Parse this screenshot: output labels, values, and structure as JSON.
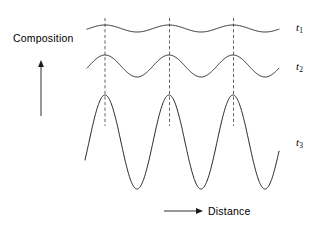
{
  "figure": {
    "background_color": "#ffffff",
    "curve_color": "#1a1a1a",
    "guide_color": "#3a3a3a",
    "width": 319,
    "height": 233
  },
  "axes": {
    "y_axis_label": "Composition",
    "x_axis_label": "Distance",
    "y_arrow": {
      "x": 41,
      "y_from": 116,
      "y_to": 60
    },
    "x_arrow": {
      "y": 211,
      "x_from": 164,
      "x_to": 203
    }
  },
  "curve_labels": [
    {
      "name": "t1",
      "base": "t",
      "sub": "1",
      "x": 296,
      "y": 21
    },
    {
      "name": "t2",
      "base": "t",
      "sub": "2",
      "x": 296,
      "y": 60
    },
    {
      "name": "t3",
      "base": "t",
      "sub": "3",
      "x": 296,
      "y": 136
    }
  ],
  "guide_lines": {
    "description": "vertical dash-dot lines marking wave peaks",
    "x_positions": [
      105,
      169.5,
      233.5
    ],
    "y_top": 18,
    "y_bottom": 126
  },
  "chart_data": {
    "type": "line",
    "xlabel": "Distance",
    "ylabel": "Composition",
    "grid": false,
    "legend": "right-inline",
    "x_start": 86,
    "x_end": 279,
    "wavelength": 64,
    "peak_x_positions": [
      105,
      169.5,
      233.5
    ],
    "series": [
      {
        "name": "t1",
        "label": "t₁",
        "center_y": 28.5,
        "amplitude": 3.5,
        "peak_y": 25,
        "trough_y": 32,
        "x_start": 87,
        "x_end": 279,
        "description": "Earliest time: very small amplitude composition fluctuation"
      },
      {
        "name": "t2",
        "label": "t₂",
        "center_y": 66,
        "amplitude": 11,
        "peak_y": 55,
        "trough_y": 77,
        "x_start": 87,
        "x_end": 279,
        "description": "Intermediate time: amplitude has grown, wavelength unchanged"
      },
      {
        "name": "t3",
        "label": "t₃",
        "center_y": 142,
        "amplitude": 47,
        "peak_y": 95,
        "trough_y": 189,
        "x_start": 85,
        "x_end": 279,
        "description": "Latest time: large amplitude approaching equilibrium compositions"
      }
    ]
  }
}
